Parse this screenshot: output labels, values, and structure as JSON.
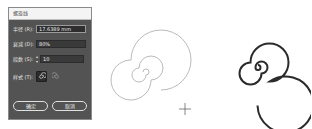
{
  "dialog": {
    "title": "螺旋线",
    "fields": [
      {
        "label": "半径 (R):",
        "value": "17.6389 mm"
      },
      {
        "label": "衰减 (D):",
        "value": "80%"
      },
      {
        "label": "段数 (S):",
        "value": "10"
      }
    ],
    "style_label": "样式 (T):",
    "style_options": [
      "counterclockwise",
      "clockwise"
    ],
    "style_selected": "counterclockwise",
    "ok_label": "确定",
    "cancel_label": "取消"
  },
  "canvas": {
    "spiral_preview_color": "#9a9a9a",
    "spiral_final_color": "#2b2b2b"
  }
}
